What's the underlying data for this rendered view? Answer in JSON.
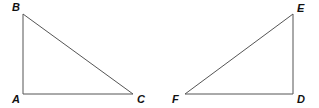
{
  "figure": {
    "triangles": [
      {
        "name": "ABC",
        "vertices": [
          {
            "label": "A",
            "x": 23,
            "y": 94,
            "lx": 12,
            "ly": 103
          },
          {
            "label": "B",
            "x": 23,
            "y": 14,
            "lx": 12,
            "ly": 11
          },
          {
            "label": "C",
            "x": 133,
            "y": 94,
            "lx": 137,
            "ly": 103
          }
        ],
        "right_angle_at": "A"
      },
      {
        "name": "DEF",
        "vertices": [
          {
            "label": "D",
            "x": 293,
            "y": 94,
            "lx": 297,
            "ly": 103
          },
          {
            "label": "E",
            "x": 293,
            "y": 14,
            "lx": 297,
            "ly": 12
          },
          {
            "label": "F",
            "x": 185,
            "y": 94,
            "lx": 172,
            "ly": 103
          }
        ],
        "right_angle_at": "D"
      }
    ],
    "colors": {
      "edge": "#555555",
      "label": "#111111",
      "background": "#ffffff"
    }
  }
}
